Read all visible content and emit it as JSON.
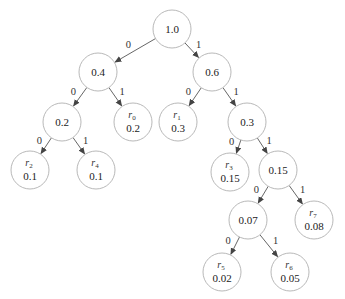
{
  "diagram": {
    "type": "binary-tree",
    "title": "",
    "node_radius": 19,
    "colors": {
      "edge": "#555555",
      "node_stroke": "#b0b0b0",
      "text": "#222222"
    },
    "nodes": [
      {
        "id": "n1_0",
        "x": 172,
        "y": 29,
        "value": "1.0",
        "label": "",
        "sub": ""
      },
      {
        "id": "n0_4",
        "x": 98,
        "y": 72,
        "value": "0.4",
        "label": "",
        "sub": ""
      },
      {
        "id": "n0_6",
        "x": 212,
        "y": 72,
        "value": "0.6",
        "label": "",
        "sub": ""
      },
      {
        "id": "n0_2",
        "x": 62,
        "y": 122,
        "value": "0.2",
        "label": "",
        "sub": ""
      },
      {
        "id": "r0",
        "x": 133,
        "y": 122,
        "value": "0.2",
        "label": "r",
        "sub": "0"
      },
      {
        "id": "r1",
        "x": 178,
        "y": 122,
        "value": "0.3",
        "label": "r",
        "sub": "1"
      },
      {
        "id": "n0_3",
        "x": 247,
        "y": 122,
        "value": "0.3",
        "label": "",
        "sub": ""
      },
      {
        "id": "r2",
        "x": 30,
        "y": 170,
        "value": "0.1",
        "label": "r",
        "sub": "2"
      },
      {
        "id": "r4",
        "x": 96,
        "y": 170,
        "value": "0.1",
        "label": "r",
        "sub": "4"
      },
      {
        "id": "r3",
        "x": 230,
        "y": 172,
        "value": "0.15",
        "label": "r",
        "sub": "3"
      },
      {
        "id": "n0_15",
        "x": 278,
        "y": 170,
        "value": "0.15",
        "label": "",
        "sub": ""
      },
      {
        "id": "n0_07",
        "x": 248,
        "y": 220,
        "value": "0.07",
        "label": "",
        "sub": ""
      },
      {
        "id": "r7",
        "x": 314,
        "y": 220,
        "value": "0.08",
        "label": "r",
        "sub": "7"
      },
      {
        "id": "r5",
        "x": 222,
        "y": 272,
        "value": "0.02",
        "label": "r",
        "sub": "5"
      },
      {
        "id": "r6",
        "x": 290,
        "y": 272,
        "value": "0.05",
        "label": "r",
        "sub": "6"
      }
    ],
    "edges": [
      {
        "from": "n1_0",
        "to": "n0_4",
        "bit": "0"
      },
      {
        "from": "n1_0",
        "to": "n0_6",
        "bit": "1"
      },
      {
        "from": "n0_4",
        "to": "n0_2",
        "bit": "0"
      },
      {
        "from": "n0_4",
        "to": "r0",
        "bit": "1"
      },
      {
        "from": "n0_6",
        "to": "r1",
        "bit": "0"
      },
      {
        "from": "n0_6",
        "to": "n0_3",
        "bit": "1"
      },
      {
        "from": "n0_2",
        "to": "r2",
        "bit": "0"
      },
      {
        "from": "n0_2",
        "to": "r4",
        "bit": "1"
      },
      {
        "from": "n0_3",
        "to": "r3",
        "bit": "0"
      },
      {
        "from": "n0_3",
        "to": "n0_15",
        "bit": "1"
      },
      {
        "from": "n0_15",
        "to": "n0_07",
        "bit": "0"
      },
      {
        "from": "n0_15",
        "to": "r7",
        "bit": "1"
      },
      {
        "from": "n0_07",
        "to": "r5",
        "bit": "0"
      },
      {
        "from": "n0_07",
        "to": "r6",
        "bit": "1"
      }
    ]
  }
}
